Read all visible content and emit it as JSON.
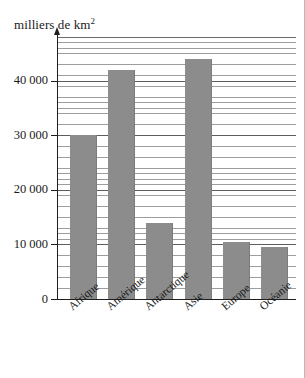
{
  "figure": {
    "unit_caption": "milliers de km",
    "unit_exponent": "2"
  },
  "axis": {
    "y_ticks": [
      "0",
      "10 000",
      "20 000",
      "30 000",
      "40 000"
    ]
  },
  "categories": [
    "Afrique",
    "Amérique",
    "Antarctique",
    "Asie",
    "Europe",
    "Océanie"
  ],
  "chart_data": {
    "type": "bar",
    "title": "milliers de km2",
    "xlabel": "",
    "ylabel": "milliers de km2",
    "categories": [
      "Afrique",
      "Amérique",
      "Antarctique",
      "Asie",
      "Europe",
      "Océanie"
    ],
    "values": [
      30000,
      42000,
      14000,
      44000,
      10500,
      9500
    ],
    "ylim": [
      0,
      48000
    ],
    "ytick_values": [
      0,
      10000,
      20000,
      30000,
      40000
    ],
    "ytick_labels": [
      "0",
      "10 000",
      "20 000",
      "30 000",
      "40 000"
    ],
    "grid": true,
    "grid_minor_step": 1000,
    "legend": null,
    "bar_color": "#8c8c8c",
    "background_color": "#ffffff",
    "axis_color": "#1e1e1e"
  }
}
